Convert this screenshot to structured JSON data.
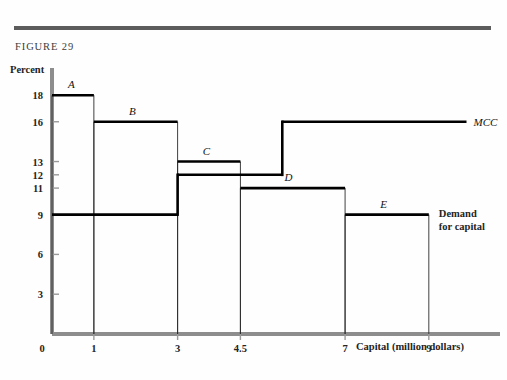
{
  "figure": {
    "label": "FIGURE 29",
    "y_axis_title": "Percent",
    "x_axis_title": "Capital (million dollars)"
  },
  "chart_data": {
    "type": "bar",
    "title": "FIGURE 29",
    "xlabel": "Capital (million dollars)",
    "ylabel": "Percent",
    "xlim": [
      0,
      10.7
    ],
    "ylim": [
      0,
      19.6
    ],
    "grid": false,
    "x_ticks": [
      "0",
      "1",
      "3",
      "4.5",
      "7",
      "9"
    ],
    "x_tick_values": [
      0,
      1,
      3,
      4.5,
      7,
      9
    ],
    "y_ticks": [
      "3",
      "6",
      "9",
      "11",
      "12",
      "13",
      "16",
      "18"
    ],
    "y_tick_values": [
      3,
      6,
      9,
      11,
      12,
      13,
      16,
      18
    ],
    "series": [
      {
        "name": "Demand for capital",
        "label": "Demand for capital",
        "label_line1": "Demand",
        "label_line2": "for capital",
        "type": "step-bars",
        "bars": [
          {
            "name": "A",
            "x_start": 0,
            "x_end": 1,
            "value": 18
          },
          {
            "name": "B",
            "x_start": 1,
            "x_end": 3,
            "value": 16
          },
          {
            "name": "C",
            "x_start": 3,
            "x_end": 4.5,
            "value": 13
          },
          {
            "name": "D",
            "x_start": 4.5,
            "x_end": 7,
            "value": 11
          },
          {
            "name": "E",
            "x_start": 7,
            "x_end": 9,
            "value": 9
          }
        ]
      },
      {
        "name": "MCC",
        "label": "MCC",
        "type": "step-line",
        "steps": [
          {
            "x_start": 0,
            "x_end": 3,
            "value": 9
          },
          {
            "x_start": 3,
            "x_end": 5.5,
            "value": 12
          },
          {
            "x_start": 5.5,
            "x_end": 9.9,
            "value": 16
          }
        ]
      }
    ],
    "equilibrium_note": ""
  }
}
